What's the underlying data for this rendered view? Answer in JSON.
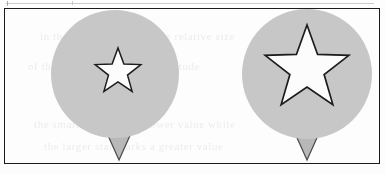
{
  "figure": {
    "caption": "",
    "background_color": "#fdfdfd",
    "frame": {
      "border_color": "#1b1b1b",
      "border_width": 1,
      "x": 4,
      "y": 8,
      "width": 376,
      "height": 156
    },
    "scan_artifacts": {
      "top_rule_color": "#b9b9b9",
      "ghost_text_opacity": "0.085",
      "ghost_lines": [
        "in the balloon diagram the relative size",
        "of the star indicates the magnitude",
        "the small star marks a lower value while",
        "the larger star marks a greater value"
      ]
    },
    "palette": {
      "circle_fill": "#c7c7c7",
      "circle_stroke": "none",
      "star_fill": "#fcfcfc",
      "star_stroke": "#1c1c1c",
      "triangle_fill": "#b8b8b8",
      "triangle_stroke": "#4a4a4a"
    },
    "shapes": [
      {
        "id": "marker-left",
        "label": "small-star-marker",
        "circle": {
          "cx": 115,
          "cy": 74,
          "r": 64
        },
        "star": {
          "cx": 118,
          "cy": 72,
          "outer_r": 24,
          "inner_r": 10,
          "rotation": 0
        },
        "tail": {
          "cx": 119,
          "top": 131,
          "half_width": 13,
          "height": 29
        },
        "star_size_class": "small",
        "relative_magnitude": "1"
      },
      {
        "id": "marker-right",
        "label": "large-star-marker",
        "circle": {
          "cx": 307,
          "cy": 74,
          "r": 65
        },
        "star": {
          "cx": 307,
          "cy": 69,
          "outer_r": 44,
          "inner_r": 18,
          "rotation": 0
        },
        "tail": {
          "cx": 307,
          "top": 131,
          "half_width": 13,
          "height": 29
        },
        "star_size_class": "large",
        "relative_magnitude": "2"
      }
    ]
  }
}
